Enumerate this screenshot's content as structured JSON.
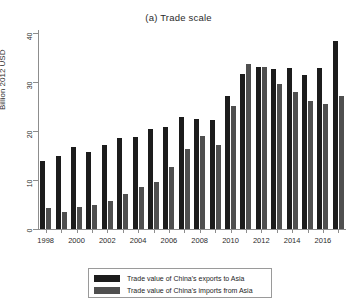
{
  "chart_data": {
    "type": "bar",
    "title": "(a) Trade scale",
    "xlabel": "",
    "ylabel": "Billion 2012 USD",
    "ylim": [
      0,
      40
    ],
    "yticks": [
      0,
      10,
      20,
      30,
      40
    ],
    "grid": false,
    "legend_position": "bottom",
    "categories": [
      "1998",
      "1999",
      "2000",
      "2001",
      "2002",
      "2003",
      "2004",
      "2005",
      "2006",
      "2007",
      "2008",
      "2009",
      "2010",
      "2011",
      "2012",
      "2013",
      "2014",
      "2015",
      "2016",
      "2017"
    ],
    "xtick_labels": [
      "1998",
      "2000",
      "2002",
      "2004",
      "2006",
      "2008",
      "2010",
      "2012",
      "2014",
      "2016"
    ],
    "series": [
      {
        "name": "Trade value of China's exports to Asia",
        "color": "#1c1c1c",
        "values": [
          13.8,
          14.9,
          16.8,
          15.7,
          17.2,
          18.5,
          18.8,
          20.4,
          20.8,
          22.9,
          22.4,
          22.3,
          27.1,
          31.6,
          33.1,
          32.7,
          32.9,
          31.5,
          32.9,
          38.3
        ]
      },
      {
        "name": "Trade value of China's imports from Asia",
        "color": "#4f4f4f",
        "values": [
          4.2,
          3.5,
          4.5,
          4.9,
          5.8,
          7.2,
          8.5,
          9.6,
          12.7,
          16.4,
          18.9,
          17.2,
          25.2,
          33.6,
          33.1,
          29.5,
          28.0,
          26.1,
          25.5,
          27.2
        ]
      }
    ]
  },
  "legend": {
    "items": [
      {
        "label": "Trade value of China's exports to Asia",
        "swatch": "exports"
      },
      {
        "label": "Trade value of China's imports from Asia",
        "swatch": "imports"
      }
    ]
  }
}
